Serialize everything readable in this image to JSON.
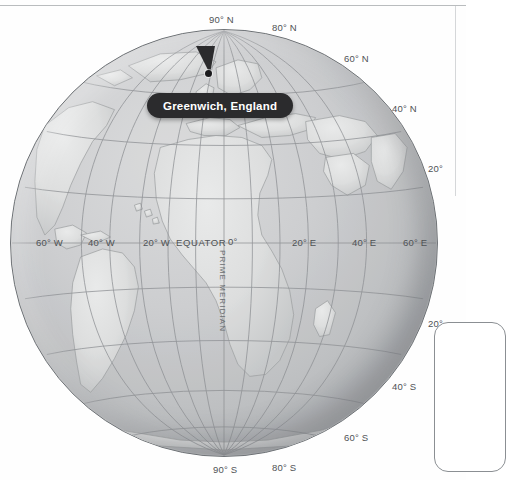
{
  "map": {
    "type": "orthographic-globe",
    "projection_center": {
      "lon": 0,
      "lat": 0
    },
    "title_callout": "Greenwich, England",
    "marker": {
      "label": "Greenwich, England",
      "lon": 0,
      "lat": 51.5
    },
    "colors": {
      "ocean": "#c6c8ca",
      "land": "#dcdddd",
      "graticule": "#8d9094",
      "outline": "#6e7276",
      "label_text": "#4f5255",
      "callout_bg": "#2b2b2d",
      "callout_text": "#ffffff",
      "panel_border": "#8b8f93"
    },
    "graticule": {
      "parallel_interval_deg": 20,
      "meridian_interval_deg": 20,
      "visible": true
    },
    "labels": {
      "equator": "EQUATOR",
      "prime_meridian": "PRIME MERIDIAN",
      "latitudes": [
        {
          "text": "90° N",
          "x": 209,
          "y": 14
        },
        {
          "text": "80° N",
          "x": 272,
          "y": 22
        },
        {
          "text": "60° N",
          "x": 344,
          "y": 53
        },
        {
          "text": "40° N",
          "x": 392,
          "y": 103
        },
        {
          "text": "20°",
          "x": 428,
          "y": 163
        },
        {
          "text": "20°",
          "x": 428,
          "y": 318
        },
        {
          "text": "40° S",
          "x": 392,
          "y": 381
        },
        {
          "text": "60° S",
          "x": 344,
          "y": 432
        },
        {
          "text": "80° S",
          "x": 272,
          "y": 462
        },
        {
          "text": "90° S",
          "x": 213,
          "y": 464
        }
      ],
      "longitudes": [
        {
          "text": "60° W",
          "x": 36,
          "y": 237
        },
        {
          "text": "40° W",
          "x": 88,
          "y": 237
        },
        {
          "text": "20° W",
          "x": 143,
          "y": 237
        },
        {
          "text": "EQUATOR",
          "x": 176,
          "y": 237
        },
        {
          "text": "0°",
          "x": 228,
          "y": 236
        },
        {
          "text": "20° E",
          "x": 292,
          "y": 237
        },
        {
          "text": "40° E",
          "x": 352,
          "y": 237
        },
        {
          "text": "60° E",
          "x": 403,
          "y": 237
        }
      ]
    }
  }
}
